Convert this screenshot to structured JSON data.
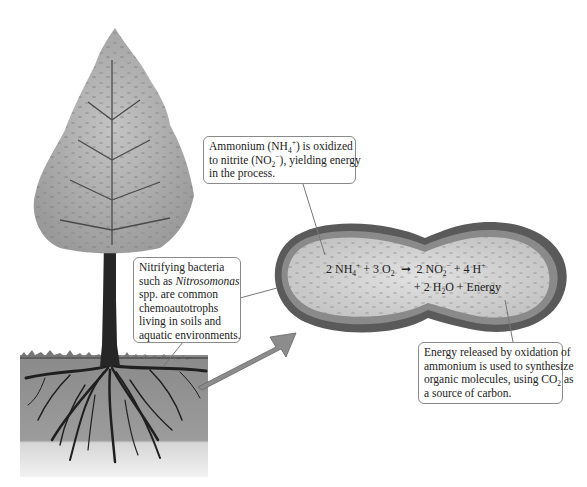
{
  "diagram": {
    "type": "biology-illustration"
  },
  "callouts": {
    "ammonium": {
      "line1_pre": "Ammonium (NH",
      "line1_sub": "4",
      "line1_sup": "+",
      "line1_post": ") is oxidized",
      "line2_pre": "to nitrite (NO",
      "line2_sub": "2",
      "line2_sup": "−",
      "line2_post": "), yielding energy",
      "line3": "in the process."
    },
    "bacteria": {
      "line1": "Nitrifying bacteria",
      "line2_pre": "such as ",
      "line2_italic": "Nitrosomonas",
      "line3": "spp. are common",
      "line4": "chemoautotrophs",
      "line5": "living in soils and",
      "line6": "aquatic environments."
    },
    "energy": {
      "line1": "Energy released by oxidation of",
      "line2": "ammonium is used to synthesize",
      "line3_pre": "organic molecules, using CO",
      "line3_sub": "2",
      "line3_post": " as",
      "line4": "a source of carbon."
    }
  },
  "equation": {
    "r1_coef": "2 NH",
    "r1_sub": "4",
    "r1_sup": "+",
    "plus1": " + 3 O",
    "r2_sub": "2",
    "arrow": "➞",
    "p1_coef": "2 NO",
    "p1_sub": "2",
    "p1_sup": "−",
    "plus2": " + 4 H",
    "p2_sup": "+",
    "line2_pre": "+ 2 H",
    "line2_sub": "2",
    "line2_post": "O + Energy"
  },
  "colors": {
    "background": "#ffffff",
    "callout_border": "#8a8a8a",
    "soil_dark": "#8f8f8f",
    "soil_light": "#d9d9d9",
    "cell_wall": "#5a5a5a",
    "cytoplasm": "#d4d4d4",
    "arrow_fill": "#8c8c8c",
    "foliage": "#a8a8a8",
    "trunk": "#2b2b2b"
  }
}
